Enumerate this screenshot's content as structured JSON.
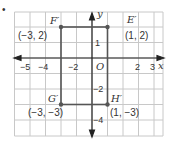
{
  "bullet": "•",
  "axes": {
    "x_label": "x",
    "y_label": "y",
    "origin_label": "O"
  },
  "x_ticks": [
    {
      "value": -5,
      "label": "−5"
    },
    {
      "value": -4,
      "label": "−4"
    },
    {
      "value": -2,
      "label": "−2"
    },
    {
      "value": 2,
      "label": "2"
    },
    {
      "value": 3,
      "label": "3"
    }
  ],
  "y_ticks": [
    {
      "value": 1,
      "label": "1"
    },
    {
      "value": -2,
      "label": "−2"
    },
    {
      "value": -4,
      "label": "−4"
    }
  ],
  "vertices": {
    "F": {
      "name": "F′",
      "coord": "(−3, 2)",
      "x": -3,
      "y": 2
    },
    "E": {
      "name": "E′",
      "coord": "(1, 2)",
      "x": 1,
      "y": 2
    },
    "G": {
      "name": "G′",
      "coord": "(−3, −3)",
      "x": -3,
      "y": -3
    },
    "H": {
      "name": "H′",
      "coord": "(1, −3)",
      "x": 1,
      "y": -3
    }
  },
  "colors": {
    "grid": "#c8c8c8",
    "axis": "#222222",
    "shape": "#555555",
    "text": "#333333"
  }
}
